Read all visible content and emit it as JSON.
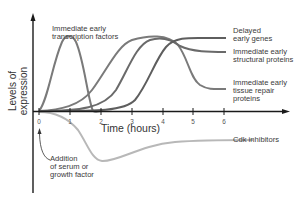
{
  "diagram": {
    "y_axis_label": "Levels of expression",
    "x_axis_label": "Time (hours)",
    "x_ticks": [
      "0",
      "1",
      "2",
      "3",
      "4",
      "5",
      "6"
    ],
    "annotation": {
      "line1": "Addition",
      "line2": "of serum or",
      "line3": "growth factor"
    },
    "curves": [
      {
        "id": "transcription",
        "line1": "Immediate early",
        "line2": "transcription factors"
      },
      {
        "id": "delayed",
        "line1": "Delayed",
        "line2": "early genes"
      },
      {
        "id": "structural",
        "line1": "Immediate early",
        "line2": "structural proteins"
      },
      {
        "id": "tissue",
        "line1": "Immediate early",
        "line2": "tissue repair",
        "line3": "proteins"
      },
      {
        "id": "cdk",
        "line1": "Cdk inhibitors"
      }
    ],
    "colors": {
      "axis": "#1a1a1a",
      "curve_dark": "#6e6e6e",
      "curve_light": "#b8b8b8",
      "text": "#3a3a3a"
    }
  }
}
